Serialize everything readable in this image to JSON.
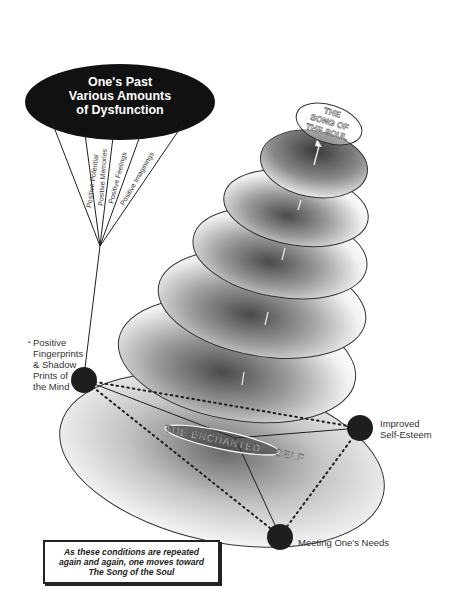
{
  "diagram": {
    "top_ellipse": {
      "lines": [
        "One's Past",
        "Various Amounts",
        "of Dysfunction"
      ],
      "fill": "#111111",
      "text_color": "#ffffff"
    },
    "fan_rays": [
      "Positive Potential",
      "Positive Memories",
      "Positive Feelings",
      "Positive Imaginings"
    ],
    "summit_label": [
      "THE",
      "SONG OF",
      "THE SOUL"
    ],
    "center_label": {
      "part1": "THE ENCHANTED",
      "part2": "SELF"
    },
    "nodes": {
      "mind": [
        "Positive",
        "Fingerprints",
        "& Shadow",
        "Prints of",
        "the Mind"
      ],
      "esteem": [
        "Improved",
        "Self-Esteem"
      ],
      "needs": "Meeting One's Needs"
    },
    "caption": [
      "As these conditions are repeated",
      "again and again, one moves toward",
      "The Song of the Soul"
    ],
    "disc_count": 6,
    "colors": {
      "ink": "#1e1e1e",
      "disc_shade": "#5a5a5a",
      "background": "#ffffff"
    }
  }
}
